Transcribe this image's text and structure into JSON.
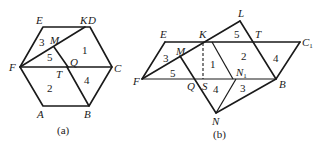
{
  "figure_a": {
    "caption": "(a)",
    "vertices": {
      "E": "E",
      "K": "K",
      "D": "D",
      "M": "M",
      "F": "F",
      "Q": "Q",
      "C": "C",
      "T": "T",
      "A": "A",
      "B": "B"
    },
    "regions": [
      "1",
      "2",
      "3",
      "4",
      "5"
    ]
  },
  "figure_b": {
    "caption": "(b)",
    "vertices": {
      "E": "E",
      "K": "K",
      "L": "L",
      "T": "T",
      "C": "C",
      "C_sub": "1",
      "M": "M",
      "F": "F",
      "Q": "Q",
      "S": "S",
      "N1": "N",
      "N1_sub": "1",
      "B": "B",
      "N": "N"
    },
    "regions": {
      "r1": "1",
      "r2": "2",
      "r3a": "3",
      "r3b": "3",
      "r4a": "4",
      "r4b": "4",
      "r5a": "5",
      "r5b": "5"
    }
  }
}
